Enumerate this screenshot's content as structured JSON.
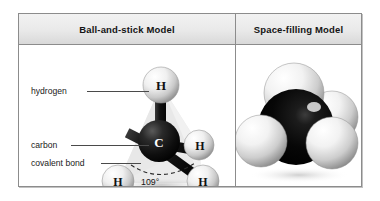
{
  "figure": {
    "columns": [
      {
        "header": "Ball-and-stick Model",
        "key": "ball_and_stick"
      },
      {
        "header": "Space-filling Model",
        "key": "space_filling"
      }
    ],
    "molecule": "methane",
    "molecular_formula": "CH4",
    "geometry": "tetrahedral"
  },
  "ball_and_stick": {
    "callouts": [
      {
        "label": "hydrogen",
        "points_to": "top-hydrogen-atom"
      },
      {
        "label": "carbon",
        "points_to": "carbon-atom"
      },
      {
        "label": "covalent bond",
        "points_to": "bond-stick"
      }
    ],
    "bond_angle": "109°",
    "atom_labels": {
      "carbon": "C",
      "hydrogen": "H"
    },
    "atoms": [
      {
        "element": "H",
        "label": "H",
        "position": "top"
      },
      {
        "element": "C",
        "label": "C",
        "position": "center"
      },
      {
        "element": "H",
        "label": "H",
        "position": "right"
      },
      {
        "element": "H",
        "label": "H",
        "position": "bottom-left"
      },
      {
        "element": "H",
        "label": "H",
        "position": "bottom-right"
      }
    ]
  },
  "space_filling": {
    "atoms": [
      {
        "element": "H",
        "position": "top"
      },
      {
        "element": "C",
        "position": "center"
      },
      {
        "element": "H",
        "position": "left"
      },
      {
        "element": "H",
        "position": "right"
      },
      {
        "element": "H",
        "position": "back-right"
      }
    ]
  },
  "colors": {
    "carbon": "#121212",
    "hydrogen": "#e8e8e8",
    "frame_border": "#8c8c8c",
    "header_background": "#e9e9e9",
    "text": "#141414",
    "leader_line": "#4a4a4a"
  }
}
